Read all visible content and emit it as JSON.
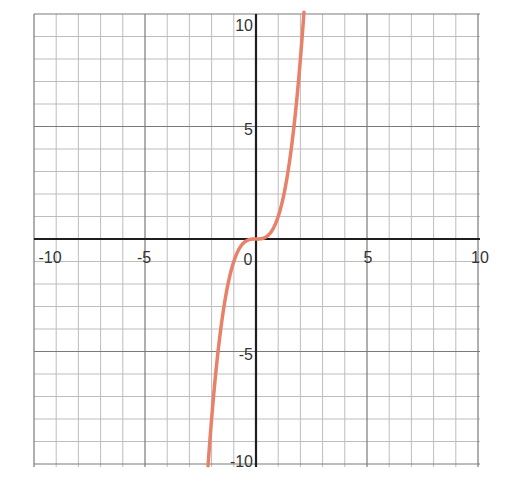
{
  "chart_data": {
    "type": "line",
    "title": "",
    "xlabel": "",
    "ylabel": "",
    "xlim": [
      -10,
      10
    ],
    "ylim": [
      -10,
      10
    ],
    "grid": true,
    "grid_step": 1,
    "major_step": 5,
    "legend": null,
    "x_tick_labels": [
      "-10",
      "-5",
      "0",
      "5",
      "10"
    ],
    "y_tick_labels": [
      "10",
      "5",
      "-5",
      "-10"
    ],
    "series": [
      {
        "name": "y = x^3",
        "color": "#e8806a",
        "x": [
          -2.15,
          -2,
          -1.5,
          -1,
          -0.5,
          0,
          0.5,
          1,
          1.5,
          2,
          2.15
        ],
        "y": [
          -9.94,
          -8,
          -3.375,
          -1,
          -0.125,
          0,
          0.125,
          1,
          3.375,
          8,
          9.94
        ]
      }
    ]
  },
  "colors": {
    "grid_minor": "#bdbdbd",
    "grid_major": "#7a7a7a",
    "axis": "#1e1e1e",
    "curve": "#e8806a"
  }
}
